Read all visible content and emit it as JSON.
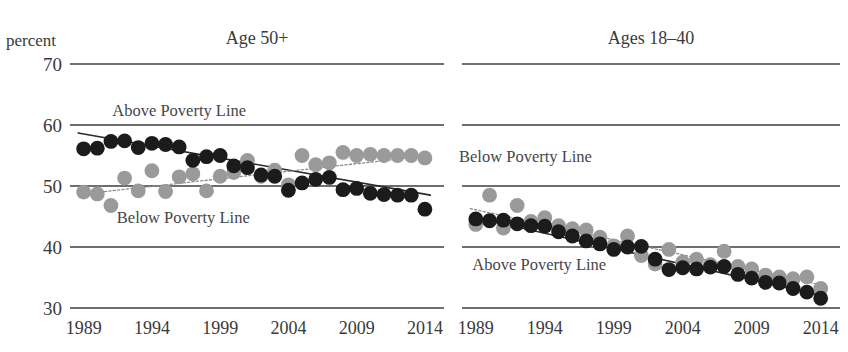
{
  "axis": {
    "unit_caption": "percent",
    "y_ticks": [
      70,
      60,
      50,
      40,
      30
    ],
    "x_ticks": [
      1989,
      1994,
      1999,
      2004,
      2009,
      2014
    ]
  },
  "colors": {
    "above_poverty_marker": "#1b1b1b",
    "below_poverty_marker": "#9a9a9a",
    "gridline": "#6e6e6e",
    "text": "#3a3a3a",
    "background": "#ffffff"
  },
  "panels": [
    {
      "id": "age-50-plus",
      "title": "Age 50+",
      "labels": {
        "above": "Above Poverty Line",
        "below": "Below Poverty Line"
      },
      "above_label_value": 61.5,
      "below_label_value": 44.0,
      "above_label_year": 1996.0,
      "below_label_year": 1996.3
    },
    {
      "id": "ages-18-40",
      "title": "Ages 18–40",
      "labels": {
        "above": "Above Poverty Line",
        "below": "Below Poverty Line"
      },
      "above_label_value": 36.2,
      "below_label_value": 54.0,
      "above_label_year": 1993.6,
      "below_label_year": 1992.6
    }
  ],
  "chart_data": [
    {
      "type": "scatter",
      "title": "Age 50+",
      "xlabel": "",
      "ylabel": "percent",
      "xlim": [
        1988,
        2015.5
      ],
      "ylim": [
        30,
        70
      ],
      "grid": "horizontal",
      "legend": "inline-annotations",
      "x": [
        1989,
        1990,
        1991,
        1992,
        1993,
        1994,
        1995,
        1996,
        1997,
        1998,
        1999,
        2000,
        2001,
        2002,
        2003,
        2004,
        2005,
        2006,
        2007,
        2008,
        2009,
        2010,
        2011,
        2012,
        2013,
        2014
      ],
      "series": [
        {
          "name": "Above Poverty Line",
          "marker": "filled-dark-circle",
          "values": [
            56.1,
            56.2,
            57.3,
            57.4,
            56.3,
            57.0,
            56.8,
            56.4,
            54.2,
            54.8,
            55.0,
            53.3,
            53.0,
            51.8,
            51.6,
            49.3,
            50.5,
            51.1,
            51.4,
            49.4,
            49.6,
            48.8,
            48.6,
            48.5,
            48.5,
            46.2
          ]
        },
        {
          "name": "Below Poverty Line",
          "marker": "filled-gray-circle",
          "values": [
            49.0,
            48.7,
            46.8,
            51.3,
            49.2,
            52.5,
            49.1,
            51.5,
            52.0,
            49.2,
            51.6,
            52.2,
            54.2,
            51.6,
            52.6,
            50.2,
            55.0,
            53.5,
            53.8,
            55.5,
            55.0,
            55.2,
            55.0,
            55.0,
            55.0,
            54.6
          ]
        }
      ],
      "trendlines": [
        {
          "name": "Above Poverty Line trend",
          "style": "solid-dark",
          "from": [
            1988.6,
            58.7
          ],
          "to": [
            2014.4,
            48.5
          ]
        },
        {
          "name": "Below Poverty Line trend",
          "style": "dotted-gray",
          "from": [
            1988.6,
            48.6
          ],
          "to": [
            2014.4,
            55.0
          ]
        }
      ]
    },
    {
      "type": "scatter",
      "title": "Ages 18–40",
      "xlabel": "",
      "ylabel": "percent",
      "xlim": [
        1988,
        2015.5
      ],
      "ylim": [
        30,
        70
      ],
      "grid": "horizontal",
      "legend": "inline-annotations",
      "x": [
        1989,
        1990,
        1991,
        1992,
        1993,
        1994,
        1995,
        1996,
        1997,
        1998,
        1999,
        2000,
        2001,
        2002,
        2003,
        2004,
        2005,
        2006,
        2007,
        2008,
        2009,
        2010,
        2011,
        2012,
        2013,
        2014
      ],
      "series": [
        {
          "name": "Above Poverty Line",
          "marker": "filled-dark-circle",
          "values": [
            44.6,
            44.3,
            44.4,
            43.8,
            43.5,
            43.4,
            42.5,
            41.8,
            41.0,
            40.5,
            39.6,
            40.0,
            40.1,
            38.0,
            36.3,
            36.6,
            36.4,
            36.7,
            36.8,
            35.5,
            34.9,
            34.2,
            34.1,
            33.2,
            32.6,
            31.6
          ]
        },
        {
          "name": "Below Poverty Line",
          "marker": "filled-gray-circle",
          "values": [
            43.7,
            48.5,
            43.1,
            46.8,
            44.2,
            44.8,
            43.5,
            43.0,
            42.8,
            41.6,
            40.2,
            41.8,
            38.6,
            37.2,
            39.6,
            37.5,
            38.0,
            37.1,
            39.3,
            36.8,
            36.4,
            35.4,
            35.1,
            34.8,
            35.1,
            33.2
          ]
        }
      ],
      "trendlines": [
        {
          "name": "Below Poverty Line trend",
          "style": "dotted-gray",
          "from": [
            1988.6,
            46.3
          ],
          "to": [
            2014.4,
            33.6
          ]
        },
        {
          "name": "Above Poverty Line trend",
          "style": "solid-dark",
          "from": [
            1988.6,
            45.0
          ],
          "to": [
            2014.4,
            31.9
          ]
        }
      ]
    }
  ]
}
